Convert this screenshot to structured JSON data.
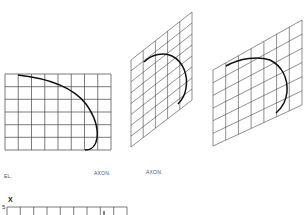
{
  "figures": [
    {
      "id": "elevation",
      "label": "EL.",
      "view": "elevation",
      "grid": {
        "cols": 8,
        "rows": 6
      }
    },
    {
      "id": "axon-1",
      "label": "AXON.",
      "view": "axonometric",
      "grid": {
        "cols": 5,
        "rows": 8
      }
    },
    {
      "id": "axon-2",
      "label": "AXON.",
      "view": "axonometric",
      "grid": {
        "cols": 7,
        "rows": 6
      }
    }
  ],
  "bottom_grid": {
    "axis_label": "X",
    "tick_label": "5",
    "cols": 9
  },
  "colors": {
    "grid": "#444444",
    "curve": "#111111",
    "background": "#ffffff"
  }
}
